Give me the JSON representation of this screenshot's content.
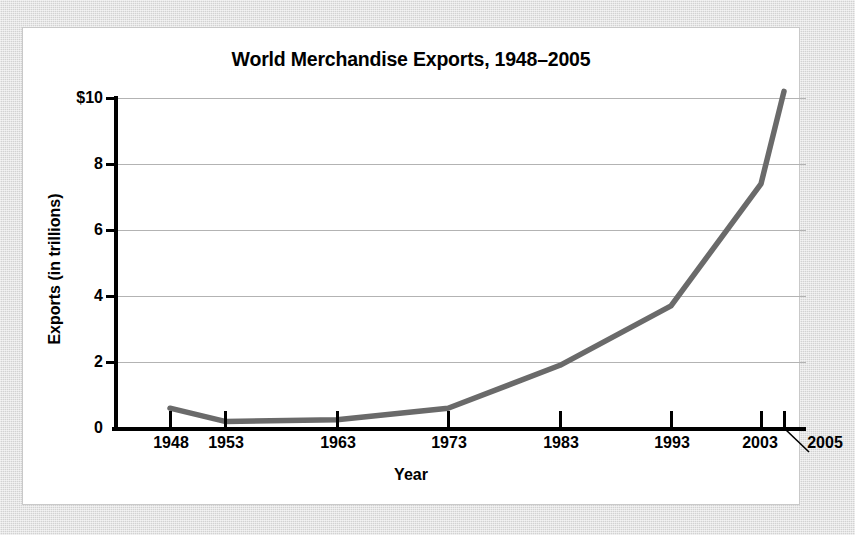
{
  "figure": {
    "background_color": "#d2d2d2",
    "card_color": "#ffffff",
    "line_color": "#6a6a6a",
    "gridline_color": "#b3b3b3",
    "axis_color": "#000000"
  },
  "chart_data": {
    "type": "line",
    "title": "World Merchandise Exports, 1948–2005",
    "xlabel": "Year",
    "ylabel": "Exports (in trillions)",
    "x": [
      1948,
      1953,
      1963,
      1973,
      1983,
      1993,
      2003,
      2005
    ],
    "categories": [
      "1948",
      "1953",
      "1963",
      "1973",
      "1983",
      "1993",
      "2003",
      "2005"
    ],
    "values": [
      0.6,
      0.2,
      0.25,
      0.6,
      1.9,
      3.7,
      7.4,
      10.2
    ],
    "xtick_labels": [
      "1948",
      "1953",
      "1963",
      "1973",
      "1983",
      "1993",
      "2003",
      "2005"
    ],
    "ytick_labels": [
      "$10",
      "8",
      "6",
      "4",
      "2",
      "0"
    ],
    "ytick_values": [
      10,
      8,
      6,
      4,
      2,
      0
    ],
    "ylim": [
      0,
      10.6
    ],
    "xlim": [
      1946,
      2008
    ],
    "grid": "horizontal",
    "legend": "none",
    "annotations": [
      {
        "name": "leader-line-2005",
        "label": "2005",
        "note": "diagonal leader line from the 2005 label up-left to the 2005 tick mark"
      }
    ]
  }
}
